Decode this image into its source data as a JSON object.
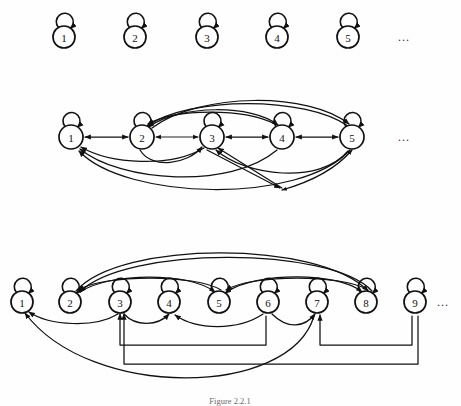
{
  "figure": {
    "caption": "Figure 2.2.1",
    "background_color": "#fefefe",
    "stroke_color": "#111111",
    "node_fill": "#ffffff",
    "width": 461,
    "height": 406
  },
  "rows": [
    {
      "id": "row-1",
      "name": "graph-row-1",
      "description": "Nine-node-spaced row of five isolated nodes, each with a self loop",
      "node_radius": 11,
      "center_y": 37,
      "ellipsis": "...",
      "ellipsis_x": 405,
      "nodes": [
        {
          "label": "1",
          "x": 64
        },
        {
          "label": "2",
          "x": 135
        },
        {
          "label": "3",
          "x": 207
        },
        {
          "label": "4",
          "x": 277
        },
        {
          "label": "5",
          "x": 348
        }
      ],
      "self_loops": [
        "1",
        "2",
        "3",
        "4",
        "5"
      ],
      "edges": []
    },
    {
      "id": "row-2",
      "name": "graph-row-2",
      "description": "Five nodes in a path with bidirectional neighbour edges plus long-range arcs",
      "node_radius": 12,
      "center_y": 137,
      "ellipsis": "...",
      "ellipsis_x": 405,
      "nodes": [
        {
          "label": "1",
          "x": 71
        },
        {
          "label": "2",
          "x": 142
        },
        {
          "label": "3",
          "x": 212
        },
        {
          "label": "4",
          "x": 282
        },
        {
          "label": "5",
          "x": 352
        }
      ],
      "self_loops": [
        "1",
        "2",
        "3",
        "4",
        "5"
      ],
      "edges": [
        {
          "from": "1",
          "to": "2",
          "kind": "bidirectional-straight"
        },
        {
          "from": "2",
          "to": "3",
          "kind": "bidirectional-straight"
        },
        {
          "from": "3",
          "to": "4",
          "kind": "bidirectional-straight"
        },
        {
          "from": "4",
          "to": "5",
          "kind": "bidirectional-straight"
        },
        {
          "from": "2",
          "to": "4",
          "kind": "arc-above"
        },
        {
          "from": "4",
          "to": "2",
          "kind": "arc-above"
        },
        {
          "from": "2",
          "to": "5",
          "kind": "arc-above-tall"
        },
        {
          "from": "5",
          "to": "2",
          "kind": "arc-above-tall"
        },
        {
          "from": "2",
          "to": "3",
          "kind": "arc-below"
        },
        {
          "from": "3",
          "to": "1",
          "kind": "arc-below"
        },
        {
          "from": "4",
          "to": "1",
          "kind": "arc-below"
        },
        {
          "from": "5",
          "to": "1",
          "kind": "arc-below-tall"
        },
        {
          "from": "5",
          "to": "3",
          "kind": "arc-below"
        },
        {
          "from": "v-join",
          "to": "3",
          "kind": "vee-leg"
        },
        {
          "from": "v-join",
          "to": "4",
          "kind": "vee-leg"
        }
      ]
    },
    {
      "id": "row-3",
      "name": "graph-row-3",
      "description": "Nine nodes with self loops, arcs above between 2-5-8 and routed orthogonal feedback paths below",
      "node_radius": 11,
      "center_y": 302,
      "ellipsis": "...",
      "ellipsis_x": 443,
      "nodes": [
        {
          "label": "1",
          "x": 22
        },
        {
          "label": "2",
          "x": 70
        },
        {
          "label": "3",
          "x": 120
        },
        {
          "label": "4",
          "x": 169
        },
        {
          "label": "5",
          "x": 219
        },
        {
          "label": "6",
          "x": 268
        },
        {
          "label": "7",
          "x": 317
        },
        {
          "label": "8",
          "x": 366
        },
        {
          "label": "9",
          "x": 415
        }
      ],
      "self_loops": [
        "1",
        "2",
        "3",
        "4",
        "5",
        "6",
        "7",
        "8",
        "9"
      ],
      "edges": [
        {
          "from": "2",
          "to": "5",
          "kind": "arc-above"
        },
        {
          "from": "5",
          "to": "2",
          "kind": "arc-above"
        },
        {
          "from": "5",
          "to": "8",
          "kind": "arc-above"
        },
        {
          "from": "8",
          "to": "5",
          "kind": "arc-above"
        },
        {
          "from": "2",
          "to": "8",
          "kind": "arc-above-tall"
        },
        {
          "from": "8",
          "to": "2",
          "kind": "arc-above-tall"
        },
        {
          "from": "3",
          "to": "1",
          "kind": "arc-below"
        },
        {
          "from": "3",
          "to": "4",
          "kind": "arc-below"
        },
        {
          "from": "6",
          "to": "4",
          "kind": "arc-below"
        },
        {
          "from": "6",
          "to": "7",
          "kind": "arc-below"
        },
        {
          "from": "6",
          "to": "3",
          "kind": "routed-orthogonal"
        },
        {
          "from": "9",
          "to": "7",
          "kind": "routed-orthogonal"
        },
        {
          "from": "9",
          "to": "3",
          "kind": "routed-orthogonal-low"
        },
        {
          "from": "7",
          "to": "1",
          "kind": "arc-below-deep"
        }
      ]
    }
  ]
}
